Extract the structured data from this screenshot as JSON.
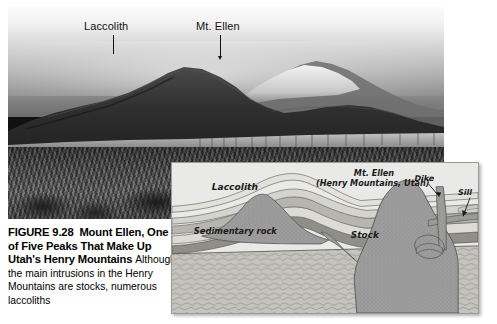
{
  "figure": {
    "number_label": "FIGURE 9.28",
    "title": "Mount Ellen, One of Five Peaks That Make Up Utah's Henry Mountains",
    "body": "Although the main intrusions in the Henry Mountains are stocks, numerous laccoliths"
  },
  "photo": {
    "alt_name": "mount-ellen-photograph",
    "labels": [
      {
        "text": "Laccolith",
        "x": 163,
        "y": 22
      },
      {
        "text": "Mt. Ellen",
        "x": 275,
        "y": 22
      }
    ]
  },
  "diagram": {
    "type": "cross-section",
    "labels": {
      "laccolith": "Laccolith",
      "mt_ellen": "Mt. Ellen",
      "mt_ellen_sub": "(Henry Mountains, Utah)",
      "sedimentary_rock": "Sedimentary rock",
      "stock": "Stock",
      "dike": "Dike",
      "sill": "Sill"
    },
    "colors": {
      "panel_background": "#e9e9e7",
      "igneous_body": "#9d9d9d",
      "sedimentary_light": "#d9d8d2",
      "sedimentary_mid": "#b9b8b2",
      "sedimentary_dark": "#8f8e88",
      "basement": "#c3c2bc",
      "stroke": "#4a4a4a"
    }
  }
}
